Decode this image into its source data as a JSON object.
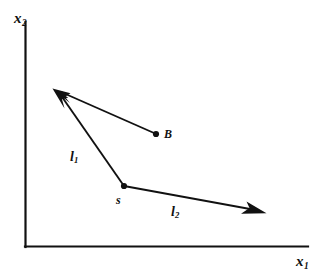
{
  "figure": {
    "background_color": "#ffffff",
    "stroke_color": "#111111",
    "axes": {
      "x_axis_label": "x",
      "x_axis_subscript": "1",
      "y_axis_label": "x",
      "y_axis_subscript": "2",
      "origin": [
        25,
        247
      ],
      "x_axis_end": [
        308,
        247
      ],
      "y_axis_end": [
        25,
        22
      ],
      "line_width": 2.2
    },
    "points": [
      {
        "id": "s",
        "label": "s",
        "x": 124,
        "y": 186,
        "marker": "filled-dot",
        "marker_radius": 3.1,
        "label_position": "below-left"
      },
      {
        "id": "B",
        "label": "B",
        "x": 156,
        "y": 134,
        "marker": "filled-dot",
        "marker_radius": 3.1,
        "label_position": "right"
      }
    ],
    "vectors": [
      {
        "id": "l1",
        "label": "l",
        "subscript": "1",
        "from": [
          124,
          186
        ],
        "to": [
          53,
          89
        ],
        "arrowhead": "solid-filled",
        "label_x": 70,
        "label_y": 150
      },
      {
        "id": "l2",
        "label": "l",
        "subscript": "2",
        "from": [
          124,
          186
        ],
        "to": [
          266,
          213
        ],
        "arrowhead": "solid-filled",
        "label_x": 171,
        "label_y": 205
      },
      {
        "id": "b-to-tip",
        "label": "",
        "subscript": "",
        "from": [
          156,
          134
        ],
        "to": [
          53,
          89
        ],
        "arrowhead": "solid-filled",
        "label_x": 0,
        "label_y": 0
      }
    ]
  }
}
